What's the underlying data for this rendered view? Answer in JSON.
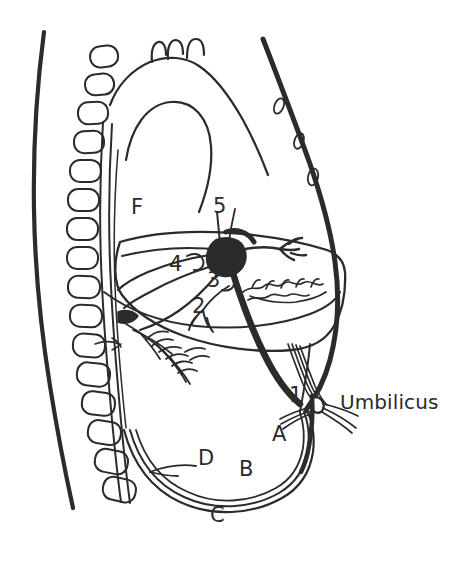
{
  "figure": {
    "background_color": "#ffffff",
    "ink_color": "#2b2b2b",
    "width": 474,
    "height": 562
  },
  "text_labels": {
    "umbilicus": "Umbilicus",
    "f": "F",
    "five": "5",
    "four": "4",
    "three": "3",
    "two": "2",
    "one": "1",
    "a": "A",
    "b": "B",
    "c": "C",
    "d": "D"
  },
  "label_positions": [
    {
      "id": "f",
      "text": "F",
      "x": 131,
      "y": 197,
      "kind": "letter"
    },
    {
      "id": "five",
      "text": "5",
      "x": 213,
      "y": 196,
      "kind": "number"
    },
    {
      "id": "four",
      "text": "4",
      "x": 169,
      "y": 254,
      "kind": "number"
    },
    {
      "id": "three",
      "text": "3",
      "x": 207,
      "y": 270,
      "kind": "number"
    },
    {
      "id": "two",
      "text": "2",
      "x": 192,
      "y": 296,
      "kind": "number"
    },
    {
      "id": "one",
      "text": "1",
      "x": 289,
      "y": 385,
      "kind": "number"
    },
    {
      "id": "a",
      "text": "A",
      "x": 272,
      "y": 424,
      "kind": "letter"
    },
    {
      "id": "d",
      "text": "D",
      "x": 198,
      "y": 448,
      "kind": "letter"
    },
    {
      "id": "b",
      "text": "B",
      "x": 239,
      "y": 459,
      "kind": "letter"
    },
    {
      "id": "c",
      "text": "C",
      "x": 210,
      "y": 505,
      "kind": "letter"
    },
    {
      "id": "umbilicus",
      "text": "Umbilicus",
      "x": 340,
      "y": 392,
      "kind": "text"
    }
  ],
  "anatomy_parts": {
    "back_contour": "posterior body wall",
    "vertebral_column": "vertebral bodies",
    "sternum_ribs": "anterior chest wall with rib cross sections",
    "aortic_arch": "aortic arch with brachiocephalic branches",
    "diaphragm": "diaphragm",
    "liver": "liver outline",
    "portal_confluence": "portal vein / ductus venosus confluence",
    "umbilical_vein": "umbilical vein",
    "umbilical_arteries": "umbilical arteries",
    "lung_vessels": "pulmonary vessel branches",
    "abdominal_wall": "anterior abdominal wall"
  },
  "vertebra_count": 16,
  "rib_oval_count": 3
}
